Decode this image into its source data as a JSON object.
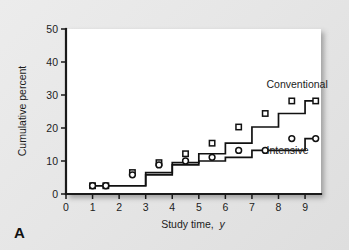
{
  "figure": {
    "panel_letter": "A",
    "background_color": "#e8e8e8",
    "panel_color": "#ffffff",
    "line_color": "#111111"
  },
  "chart_data": {
    "type": "line",
    "subtype": "step",
    "title": "",
    "xlabel_main": "Study time,",
    "xlabel_italic": "y",
    "xlabel": "Study time, y",
    "ylabel": "Cumulative percent",
    "xlim": [
      0,
      9.6
    ],
    "ylim": [
      0,
      50
    ],
    "xticks": [
      0,
      1,
      2,
      3,
      4,
      5,
      6,
      7,
      8,
      9
    ],
    "xticklabels": [
      "0",
      "1",
      "2",
      "3",
      "4",
      "5",
      "6",
      "7",
      "8",
      "9"
    ],
    "yticks": [
      0,
      10,
      20,
      30,
      40,
      50
    ],
    "yticklabels": [
      "0",
      "10",
      "20",
      "30",
      "40",
      "50"
    ],
    "grid": false,
    "legend_position": "inline-annotation",
    "series": [
      {
        "name": "Conventional",
        "marker": "square",
        "label_x": 7.55,
        "label_y": 32.0,
        "x": [
          1.0,
          1.5,
          2.5,
          3.5,
          4.5,
          5.5,
          6.5,
          7.5,
          8.5,
          9.4
        ],
        "values": [
          2.5,
          2.5,
          6.5,
          9.5,
          12.2,
          15.4,
          20.3,
          24.4,
          28.2,
          28.2
        ],
        "step_edges": [
          1.0,
          2.0,
          3.0,
          4.0,
          5.0,
          6.0,
          7.0,
          8.0,
          9.0,
          9.4
        ]
      },
      {
        "name": "Intensive",
        "marker": "circle",
        "label_x": 7.55,
        "label_y": 12.0,
        "x": [
          1.0,
          1.5,
          2.5,
          3.5,
          4.5,
          5.5,
          6.5,
          7.5,
          8.5,
          9.4
        ],
        "values": [
          2.5,
          2.5,
          5.8,
          8.8,
          10.0,
          11.1,
          13.2,
          13.2,
          16.8,
          16.8
        ],
        "step_edges": [
          1.0,
          2.0,
          3.0,
          4.0,
          5.0,
          6.0,
          7.0,
          8.0,
          9.0,
          9.4
        ]
      }
    ]
  }
}
